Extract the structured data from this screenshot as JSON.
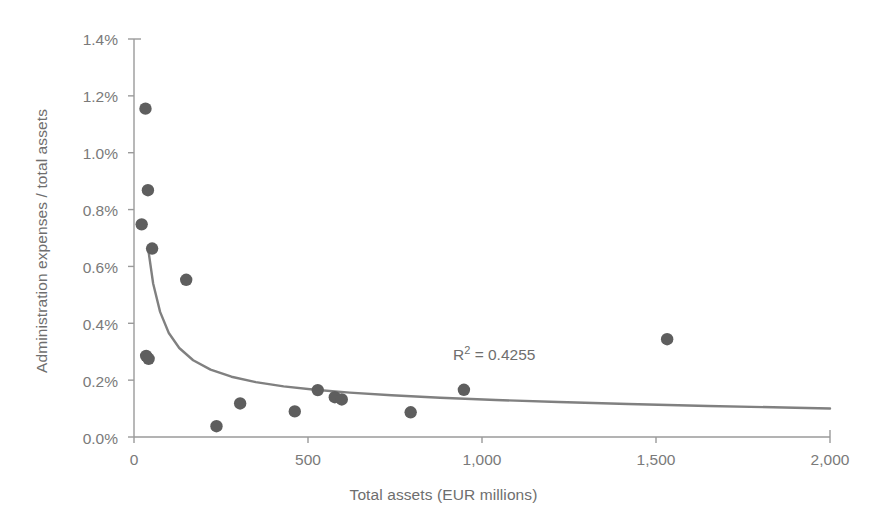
{
  "chart_data": {
    "type": "scatter",
    "title": "",
    "xlabel": "Total assets (EUR  millions)",
    "ylabel": "Administration expenses / total assets",
    "xlim": [
      0,
      2000
    ],
    "ylim": [
      0,
      1.4
    ],
    "grid": false,
    "legend": false,
    "x_ticks": [
      0,
      500,
      1000,
      1500,
      2000
    ],
    "x_tick_labels": [
      "0",
      "500",
      "1,000",
      "1,500",
      "2,000"
    ],
    "y_ticks": [
      0.0,
      0.2,
      0.4,
      0.6,
      0.8,
      1.0,
      1.2,
      1.4
    ],
    "y_tick_labels": [
      "0.0%",
      "0.2%",
      "0.4%",
      "0.6%",
      "0.8%",
      "1.0%",
      "1.2%",
      "1.4%"
    ],
    "marker_color": "#5e5e5e",
    "trendline_color": "#808080",
    "axis_color": "#9a9a9a",
    "points": [
      {
        "x": 33,
        "y": 1.155
      },
      {
        "x": 40,
        "y": 0.868
      },
      {
        "x": 22,
        "y": 0.748
      },
      {
        "x": 52,
        "y": 0.663
      },
      {
        "x": 150,
        "y": 0.553
      },
      {
        "x": 35,
        "y": 0.285
      },
      {
        "x": 42,
        "y": 0.275
      },
      {
        "x": 237,
        "y": 0.038
      },
      {
        "x": 305,
        "y": 0.118
      },
      {
        "x": 462,
        "y": 0.09
      },
      {
        "x": 528,
        "y": 0.165
      },
      {
        "x": 577,
        "y": 0.14
      },
      {
        "x": 597,
        "y": 0.132
      },
      {
        "x": 795,
        "y": 0.087
      },
      {
        "x": 948,
        "y": 0.166
      },
      {
        "x": 1532,
        "y": 0.344
      }
    ],
    "trendline": {
      "type": "power",
      "label": "R² = 0.4255",
      "r_squared": 0.4255,
      "x_start": 40,
      "x_end": 2000,
      "points": [
        {
          "x": 40,
          "y": 0.668
        },
        {
          "x": 55,
          "y": 0.54
        },
        {
          "x": 75,
          "y": 0.44
        },
        {
          "x": 100,
          "y": 0.366
        },
        {
          "x": 130,
          "y": 0.313
        },
        {
          "x": 170,
          "y": 0.27
        },
        {
          "x": 220,
          "y": 0.237
        },
        {
          "x": 280,
          "y": 0.212
        },
        {
          "x": 350,
          "y": 0.193
        },
        {
          "x": 430,
          "y": 0.178
        },
        {
          "x": 520,
          "y": 0.166
        },
        {
          "x": 620,
          "y": 0.156
        },
        {
          "x": 740,
          "y": 0.147
        },
        {
          "x": 880,
          "y": 0.138
        },
        {
          "x": 1040,
          "y": 0.13
        },
        {
          "x": 1220,
          "y": 0.123
        },
        {
          "x": 1420,
          "y": 0.116
        },
        {
          "x": 1650,
          "y": 0.109
        },
        {
          "x": 1900,
          "y": 0.103
        },
        {
          "x": 2000,
          "y": 0.1
        }
      ]
    },
    "annotations": [
      {
        "text": "R² = 0.4255",
        "x": 1250,
        "y": 0.3
      }
    ]
  }
}
